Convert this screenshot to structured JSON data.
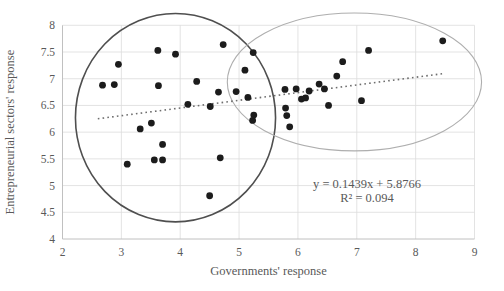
{
  "chart_data": {
    "type": "scatter",
    "title": "",
    "xlabel": "Governments' response",
    "ylabel": "Entrepreneurial sectors' response",
    "xlim": [
      2,
      9
    ],
    "ylim": [
      4,
      8
    ],
    "x_ticks": [
      2,
      3,
      4,
      5,
      6,
      7,
      8,
      9
    ],
    "y_ticks": [
      4,
      4.5,
      5,
      5.5,
      6,
      6.5,
      7,
      7.5,
      8
    ],
    "grid": true,
    "legend": "none",
    "points": [
      [
        2.68,
        6.88
      ],
      [
        2.88,
        6.89
      ],
      [
        2.95,
        7.27
      ],
      [
        3.1,
        5.4
      ],
      [
        3.32,
        6.06
      ],
      [
        3.51,
        6.17
      ],
      [
        3.56,
        5.48
      ],
      [
        3.62,
        7.53
      ],
      [
        3.63,
        6.87
      ],
      [
        3.7,
        5.77
      ],
      [
        3.7,
        5.48
      ],
      [
        3.92,
        7.46
      ],
      [
        4.13,
        6.52
      ],
      [
        4.28,
        6.95
      ],
      [
        4.5,
        4.81
      ],
      [
        4.51,
        6.48
      ],
      [
        4.65,
        6.75
      ],
      [
        4.68,
        5.52
      ],
      [
        4.73,
        7.64
      ],
      [
        4.95,
        6.76
      ],
      [
        5.1,
        7.16
      ],
      [
        5.15,
        6.65
      ],
      [
        5.23,
        6.22
      ],
      [
        5.25,
        6.32
      ],
      [
        5.24,
        7.49
      ],
      [
        5.78,
        6.8
      ],
      [
        5.79,
        6.45
      ],
      [
        5.81,
        6.31
      ],
      [
        5.86,
        6.1
      ],
      [
        5.97,
        6.81
      ],
      [
        6.06,
        6.62
      ],
      [
        6.13,
        6.64
      ],
      [
        6.19,
        6.77
      ],
      [
        6.36,
        6.9
      ],
      [
        6.45,
        6.81
      ],
      [
        6.52,
        6.5
      ],
      [
        6.66,
        7.05
      ],
      [
        6.76,
        7.32
      ],
      [
        7.08,
        6.59
      ],
      [
        7.2,
        7.53
      ],
      [
        8.46,
        7.71
      ]
    ],
    "trendline": {
      "slope": 0.1439,
      "intercept": 5.8766,
      "x_start": 2.6,
      "x_end": 8.46,
      "equation_label": "y = 0.1439x + 5.8766",
      "r_squared_label": "R² = 0.094",
      "style": "dotted"
    },
    "annotations": {
      "cluster_ellipses": [
        {
          "name": "left-cluster-ellipse",
          "cx": 3.92,
          "cy": 6.27,
          "rx": 1.7,
          "ry": 1.95,
          "stroke": "#4f4f4f",
          "stroke_width": 1.6
        },
        {
          "name": "right-cluster-ellipse",
          "cx": 6.96,
          "cy": 6.94,
          "rx": 2.16,
          "ry": 1.29,
          "stroke": "#aeaeae",
          "stroke_width": 1.1
        }
      ]
    }
  },
  "colors": {
    "background": "#ffffff",
    "point": "#1c1c1c",
    "trendline": "#6e6e6e",
    "grid": "#dcdcdc",
    "axis": "#c0c0c0",
    "text": "#595959"
  }
}
